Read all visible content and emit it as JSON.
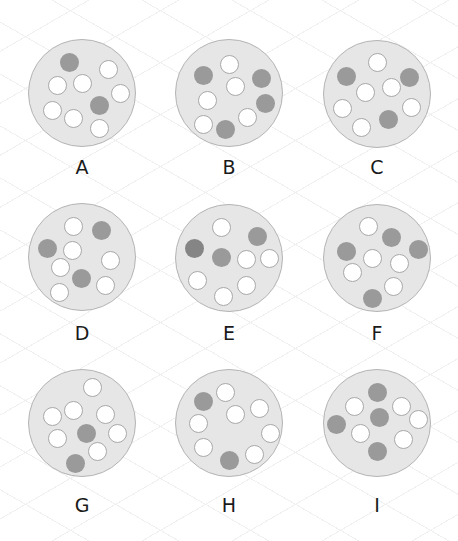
{
  "colors": {
    "disc_fill": "#e6e6e6",
    "disc_stroke": "#b4b4b4",
    "dot_white": "#ffffff",
    "dot_white_stroke": "#a8a8a8",
    "dot_dark": "#9a9a9a",
    "dot_darker": "#858585"
  },
  "disc_radius": 54,
  "dot_radius": 9.5,
  "panels": [
    {
      "label": "A",
      "cx": 82,
      "cy": 93,
      "label_y": 158,
      "dots": [
        {
          "x": 69,
          "y": 62,
          "type": "dark"
        },
        {
          "x": 108,
          "y": 69,
          "type": "white"
        },
        {
          "x": 57,
          "y": 85,
          "type": "white"
        },
        {
          "x": 82,
          "y": 83,
          "type": "white"
        },
        {
          "x": 120,
          "y": 93,
          "type": "white"
        },
        {
          "x": 99,
          "y": 105,
          "type": "dark"
        },
        {
          "x": 52,
          "y": 110,
          "type": "white"
        },
        {
          "x": 73,
          "y": 118,
          "type": "white"
        },
        {
          "x": 99,
          "y": 128,
          "type": "white"
        }
      ]
    },
    {
      "label": "B",
      "cx": 229,
      "cy": 93,
      "label_y": 158,
      "dots": [
        {
          "x": 229,
          "y": 64,
          "type": "white"
        },
        {
          "x": 203,
          "y": 75,
          "type": "dark"
        },
        {
          "x": 261,
          "y": 78,
          "type": "dark"
        },
        {
          "x": 235,
          "y": 86,
          "type": "white"
        },
        {
          "x": 207,
          "y": 100,
          "type": "white"
        },
        {
          "x": 265,
          "y": 103,
          "type": "dark"
        },
        {
          "x": 247,
          "y": 117,
          "type": "white"
        },
        {
          "x": 203,
          "y": 124,
          "type": "white"
        },
        {
          "x": 225,
          "y": 129,
          "type": "dark"
        }
      ]
    },
    {
      "label": "C",
      "cx": 377,
      "cy": 94,
      "label_y": 158,
      "dots": [
        {
          "x": 377,
          "y": 62,
          "type": "white"
        },
        {
          "x": 346,
          "y": 76,
          "type": "dark"
        },
        {
          "x": 409,
          "y": 77,
          "type": "dark"
        },
        {
          "x": 365,
          "y": 92,
          "type": "white"
        },
        {
          "x": 391,
          "y": 87,
          "type": "white"
        },
        {
          "x": 342,
          "y": 108,
          "type": "white"
        },
        {
          "x": 411,
          "y": 107,
          "type": "white"
        },
        {
          "x": 388,
          "y": 119,
          "type": "dark"
        },
        {
          "x": 361,
          "y": 127,
          "type": "white"
        }
      ]
    },
    {
      "label": "D",
      "cx": 82,
      "cy": 257,
      "label_y": 324,
      "dots": [
        {
          "x": 73,
          "y": 226,
          "type": "white"
        },
        {
          "x": 101,
          "y": 230,
          "type": "dark"
        },
        {
          "x": 47,
          "y": 248,
          "type": "dark"
        },
        {
          "x": 72,
          "y": 250,
          "type": "white"
        },
        {
          "x": 110,
          "y": 260,
          "type": "white"
        },
        {
          "x": 60,
          "y": 267,
          "type": "white"
        },
        {
          "x": 81,
          "y": 278,
          "type": "dark"
        },
        {
          "x": 105,
          "y": 285,
          "type": "white"
        },
        {
          "x": 59,
          "y": 292,
          "type": "white"
        }
      ]
    },
    {
      "label": "E",
      "cx": 229,
      "cy": 258,
      "label_y": 324,
      "dots": [
        {
          "x": 221,
          "y": 227,
          "type": "white"
        },
        {
          "x": 257,
          "y": 236,
          "type": "dark"
        },
        {
          "x": 194,
          "y": 248,
          "type": "darker"
        },
        {
          "x": 221,
          "y": 257,
          "type": "dark"
        },
        {
          "x": 246,
          "y": 259,
          "type": "white"
        },
        {
          "x": 269,
          "y": 258,
          "type": "white"
        },
        {
          "x": 197,
          "y": 280,
          "type": "white"
        },
        {
          "x": 246,
          "y": 285,
          "type": "white"
        },
        {
          "x": 223,
          "y": 296,
          "type": "white"
        }
      ]
    },
    {
      "label": "F",
      "cx": 377,
      "cy": 258,
      "label_y": 324,
      "dots": [
        {
          "x": 368,
          "y": 226,
          "type": "white"
        },
        {
          "x": 391,
          "y": 237,
          "type": "dark"
        },
        {
          "x": 346,
          "y": 251,
          "type": "dark"
        },
        {
          "x": 418,
          "y": 249,
          "type": "dark"
        },
        {
          "x": 372,
          "y": 258,
          "type": "white"
        },
        {
          "x": 399,
          "y": 263,
          "type": "white"
        },
        {
          "x": 352,
          "y": 272,
          "type": "white"
        },
        {
          "x": 393,
          "y": 286,
          "type": "white"
        },
        {
          "x": 372,
          "y": 298,
          "type": "dark"
        }
      ]
    },
    {
      "label": "G",
      "cx": 82,
      "cy": 423,
      "label_y": 496,
      "dots": [
        {
          "x": 92,
          "y": 387,
          "type": "white"
        },
        {
          "x": 52,
          "y": 416,
          "type": "white"
        },
        {
          "x": 73,
          "y": 410,
          "type": "white"
        },
        {
          "x": 105,
          "y": 414,
          "type": "white"
        },
        {
          "x": 86,
          "y": 433,
          "type": "dark"
        },
        {
          "x": 117,
          "y": 433,
          "type": "white"
        },
        {
          "x": 57,
          "y": 438,
          "type": "white"
        },
        {
          "x": 97,
          "y": 451,
          "type": "white"
        },
        {
          "x": 75,
          "y": 463,
          "type": "dark"
        }
      ]
    },
    {
      "label": "H",
      "cx": 229,
      "cy": 423,
      "label_y": 496,
      "dots": [
        {
          "x": 225,
          "y": 392,
          "type": "white"
        },
        {
          "x": 203,
          "y": 401,
          "type": "dark"
        },
        {
          "x": 259,
          "y": 408,
          "type": "white"
        },
        {
          "x": 235,
          "y": 414,
          "type": "white"
        },
        {
          "x": 198,
          "y": 423,
          "type": "white"
        },
        {
          "x": 270,
          "y": 433,
          "type": "white"
        },
        {
          "x": 203,
          "y": 447,
          "type": "white"
        },
        {
          "x": 229,
          "y": 460,
          "type": "dark"
        },
        {
          "x": 254,
          "y": 454,
          "type": "white"
        }
      ]
    },
    {
      "label": "I",
      "cx": 377,
      "cy": 423,
      "label_y": 496,
      "dots": [
        {
          "x": 377,
          "y": 392,
          "type": "dark"
        },
        {
          "x": 354,
          "y": 406,
          "type": "white"
        },
        {
          "x": 401,
          "y": 406,
          "type": "white"
        },
        {
          "x": 379,
          "y": 417,
          "type": "dark"
        },
        {
          "x": 418,
          "y": 419,
          "type": "white"
        },
        {
          "x": 336,
          "y": 424,
          "type": "dark"
        },
        {
          "x": 360,
          "y": 433,
          "type": "white"
        },
        {
          "x": 403,
          "y": 439,
          "type": "white"
        },
        {
          "x": 377,
          "y": 451,
          "type": "dark"
        }
      ]
    }
  ]
}
